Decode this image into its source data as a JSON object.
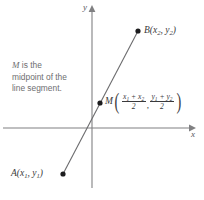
{
  "figure": {
    "background_color": "#ffffff"
  },
  "axes": {
    "x_label": "x",
    "y_label": "y",
    "axis_color": "#808082",
    "origin": {
      "x": 92,
      "y": 128
    }
  },
  "caption": {
    "line1_emphasis": "M",
    "line1_rest": " is the",
    "line2": "midpoint of the",
    "line3": "line segment.",
    "color": "#6e6e70"
  },
  "points": [
    {
      "id": "B",
      "name": "B",
      "label_name": "B",
      "label_x1": "x",
      "label_sub1": "2",
      "label_sep": ", ",
      "label_x2": "y",
      "label_sub2": "2",
      "px": 138,
      "py": 31,
      "color": "#1c1c1e"
    },
    {
      "id": "A",
      "name": "A",
      "label_name": "A",
      "label_x1": "x",
      "label_sub1": "1",
      "label_sep": ", ",
      "label_x2": "y",
      "label_sub2": "1",
      "px": 63,
      "py": 174,
      "color": "#1c1c1e"
    },
    {
      "id": "M",
      "name": "M",
      "px": 100,
      "py": 103,
      "color": "#1c1c1e"
    }
  ],
  "segment": {
    "from": "A",
    "to": "B",
    "color": "#6b6b6d"
  },
  "midpoint_formula": {
    "symbol": "M",
    "open_paren": "(",
    "close_paren": ")",
    "comma": ",",
    "x_numerator_a": "x",
    "x_numerator_a_sub": "1",
    "x_numerator_plus": "+",
    "x_numerator_b": "x",
    "x_numerator_b_sub": "2",
    "x_denominator": "2",
    "y_numerator_a": "y",
    "y_numerator_a_sub": "1",
    "y_numerator_plus": "+",
    "y_numerator_b": "y",
    "y_numerator_b_sub": "2",
    "y_denominator": "2"
  }
}
